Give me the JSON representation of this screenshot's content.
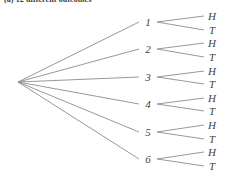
{
  "caption": {
    "text": "(a)  12 different outcomes"
  },
  "diagram": {
    "type": "probability-tree",
    "root": {
      "label": "",
      "x": 18,
      "y": 82
    },
    "colors": {
      "line": "#8c8c8c",
      "text": "#3f3f3f",
      "background": "#ffffff"
    },
    "level1": {
      "name": "die-roll",
      "x": 148,
      "nodes": [
        {
          "label": "1",
          "y": 22
        },
        {
          "label": "2",
          "y": 49
        },
        {
          "label": "3",
          "y": 77
        },
        {
          "label": "4",
          "y": 104
        },
        {
          "label": "5",
          "y": 132
        },
        {
          "label": "6",
          "y": 159
        }
      ]
    },
    "level2": {
      "name": "coin-flip",
      "x": 212,
      "nodes": [
        {
          "label": "H",
          "y": 16,
          "parent": 0
        },
        {
          "label": "T",
          "y": 30,
          "parent": 0
        },
        {
          "label": "H",
          "y": 43,
          "parent": 1
        },
        {
          "label": "T",
          "y": 57,
          "parent": 1
        },
        {
          "label": "H",
          "y": 71,
          "parent": 2
        },
        {
          "label": "T",
          "y": 84,
          "parent": 2
        },
        {
          "label": "H",
          "y": 98,
          "parent": 3
        },
        {
          "label": "T",
          "y": 111,
          "parent": 3
        },
        {
          "label": "H",
          "y": 125,
          "parent": 4
        },
        {
          "label": "T",
          "y": 139,
          "parent": 4
        },
        {
          "label": "H",
          "y": 152,
          "parent": 5
        },
        {
          "label": "T",
          "y": 166,
          "parent": 5
        }
      ]
    }
  }
}
